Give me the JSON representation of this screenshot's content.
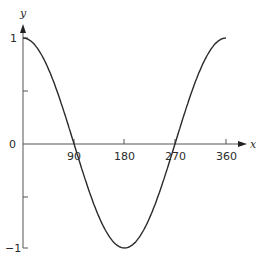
{
  "chart_data": {
    "type": "line",
    "title": "",
    "xlabel": "x",
    "ylabel": "y",
    "x_ticks": [
      "90",
      "180",
      "270",
      "360"
    ],
    "y_ticks": [
      "1",
      "0",
      "−1"
    ],
    "xlim": [
      0,
      360
    ],
    "ylim": [
      -1,
      1
    ],
    "grid": false,
    "series": [
      {
        "name": "y = cos x",
        "x": [
          0,
          30,
          60,
          90,
          120,
          150,
          180,
          210,
          240,
          270,
          300,
          330,
          360
        ],
        "y": [
          1,
          0.866,
          0.5,
          0,
          -0.5,
          -0.866,
          -1,
          -0.866,
          -0.5,
          0,
          0.5,
          0.866,
          1
        ]
      }
    ]
  }
}
